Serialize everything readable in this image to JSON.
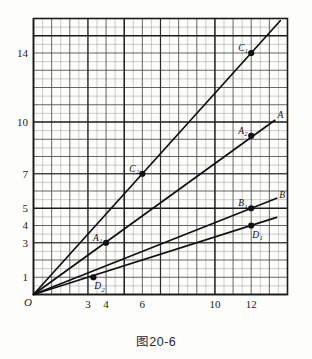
{
  "caption": "图20-6",
  "chart_data": {
    "type": "line",
    "title": "图20-6",
    "xlabel": "",
    "ylabel": "",
    "origin_label": "O",
    "xlim": [
      0,
      14
    ],
    "ylim": [
      0,
      16
    ],
    "grid": true,
    "grid_minor_step": 0.5,
    "grid_major_step": 1,
    "grid_heavy_step": 5,
    "legend": "none",
    "xticks": [
      3,
      4,
      6,
      10,
      12
    ],
    "xticklabels": [
      "3",
      "4",
      "6",
      "10",
      "12"
    ],
    "yticks": [
      1,
      3,
      4,
      5,
      7,
      10,
      14
    ],
    "yticklabels": [
      "1",
      "3",
      "4",
      "5",
      "7",
      "10",
      "14"
    ],
    "series": [
      {
        "name": "C",
        "end_label": "",
        "slope": 1.1667,
        "x": [
          0,
          13.6
        ],
        "y": [
          0,
          15.87
        ],
        "points": [
          {
            "label": "C",
            "sub": "2",
            "x": 6,
            "y": 7,
            "label_pos": "left"
          },
          {
            "label": "C",
            "sub": "1",
            "x": 12,
            "y": 14,
            "label_pos": "left"
          }
        ]
      },
      {
        "name": "A",
        "end_label": "A",
        "slope": 0.76,
        "x": [
          0,
          13.3
        ],
        "y": [
          0,
          10.1
        ],
        "points": [
          {
            "label": "A",
            "sub": "1",
            "x": 4,
            "y": 3,
            "label_pos": "left"
          },
          {
            "label": "A",
            "sub": "2",
            "x": 12,
            "y": 9.2,
            "label_pos": "left"
          }
        ]
      },
      {
        "name": "B",
        "end_label": "B",
        "slope": 0.4167,
        "x": [
          0,
          13.4
        ],
        "y": [
          0,
          5.58
        ],
        "points": [
          {
            "label": "B",
            "sub": "1",
            "x": 12,
            "y": 5,
            "label_pos": "left"
          }
        ]
      },
      {
        "name": "D",
        "end_label": "",
        "slope": 0.3333,
        "x": [
          0,
          13.4
        ],
        "y": [
          0,
          4.47
        ],
        "points": [
          {
            "label": "D",
            "sub": "2",
            "x": 3.3,
            "y": 1,
            "label_pos": "below"
          },
          {
            "label": "D",
            "sub": "1",
            "x": 12,
            "y": 4,
            "label_pos": "below"
          }
        ]
      }
    ],
    "end_labels": [
      {
        "text": "A",
        "x": 13.45,
        "y": 10.25
      },
      {
        "text": "B",
        "x": 13.55,
        "y": 5.6
      }
    ]
  }
}
